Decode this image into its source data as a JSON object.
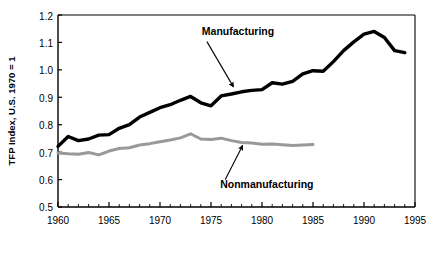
{
  "chart_data": {
    "type": "line",
    "title": "",
    "xlabel": "",
    "ylabel": "TFP Index, U.S. 1970 = 1",
    "xlim": [
      1960,
      1995
    ],
    "ylim": [
      0.5,
      1.2
    ],
    "grid": false,
    "legend_position": "inline-annotations",
    "xticks": [
      1960,
      1965,
      1970,
      1975,
      1980,
      1985,
      1990,
      1995
    ],
    "xtick_labels": [
      "1960",
      "1965",
      "1970",
      "1975",
      "1980",
      "1985",
      "1990",
      "1995"
    ],
    "minor_xtick_interval": 1,
    "yticks": [
      0.5,
      0.6,
      0.7,
      0.8,
      0.9,
      1.0,
      1.1,
      1.2
    ],
    "ytick_labels": [
      "0.5",
      "0.6",
      "0.7",
      "0.8",
      "0.9",
      "1.0",
      "1.1",
      "1.2"
    ],
    "series": [
      {
        "name": "Manufacturing",
        "color": "#000000",
        "line_width": 3.4,
        "x": [
          1960,
          1961,
          1962,
          1963,
          1964,
          1965,
          1966,
          1967,
          1968,
          1969,
          1970,
          1971,
          1972,
          1973,
          1974,
          1975,
          1976,
          1977,
          1978,
          1979,
          1980,
          1981,
          1982,
          1983,
          1984,
          1985,
          1986,
          1987,
          1988,
          1989,
          1990,
          1991,
          1992,
          1993,
          1994
        ],
        "values": [
          0.721,
          0.757,
          0.742,
          0.748,
          0.762,
          0.764,
          0.787,
          0.8,
          0.828,
          0.845,
          0.862,
          0.873,
          0.889,
          0.903,
          0.88,
          0.869,
          0.905,
          0.912,
          0.92,
          0.925,
          0.928,
          0.953,
          0.948,
          0.958,
          0.985,
          0.997,
          0.995,
          1.03,
          1.07,
          1.102,
          1.13,
          1.14,
          1.118,
          1.07,
          1.063
        ]
      },
      {
        "name": "Nonmanufacturing",
        "color": "#999999",
        "line_width": 3.0,
        "x": [
          1960,
          1961,
          1962,
          1963,
          1964,
          1965,
          1966,
          1967,
          1968,
          1969,
          1970,
          1971,
          1972,
          1973,
          1974,
          1975,
          1976,
          1977,
          1978,
          1979,
          1980,
          1981,
          1982,
          1983,
          1984,
          1985
        ],
        "values": [
          0.697,
          0.694,
          0.692,
          0.699,
          0.69,
          0.704,
          0.713,
          0.716,
          0.726,
          0.731,
          0.738,
          0.744,
          0.752,
          0.767,
          0.748,
          0.746,
          0.751,
          0.742,
          0.735,
          0.733,
          0.729,
          0.73,
          0.727,
          0.724,
          0.726,
          0.728
        ]
      }
    ],
    "annotations": [
      {
        "label": "Manufacturing",
        "text_x": 1974.1,
        "text_y": 1.128,
        "arrow_from_x": 1974.6,
        "arrow_from_y": 1.103,
        "arrow_to_x": 1977.2,
        "arrow_to_y": 0.938
      },
      {
        "label": "Nonmanufacturing",
        "text_x": 1975.9,
        "text_y": 0.571,
        "arrow_from_x": 1976.4,
        "arrow_from_y": 0.6,
        "arrow_to_x": 1978.1,
        "arrow_to_y": 0.724
      }
    ]
  }
}
